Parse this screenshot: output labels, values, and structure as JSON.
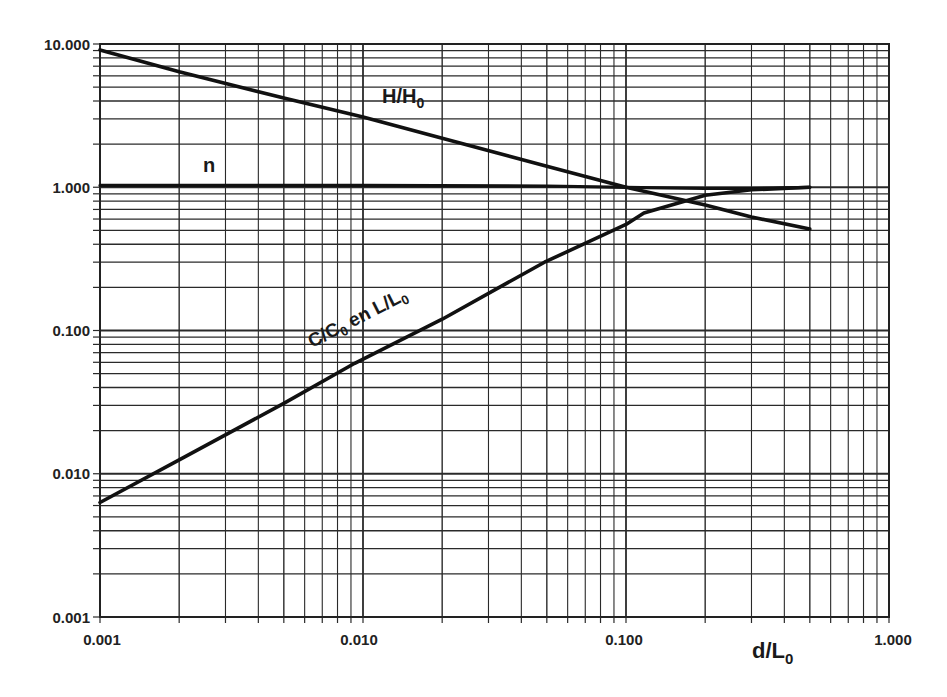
{
  "chart_data": {
    "type": "line",
    "title": "",
    "xlabel": "d/L0",
    "ylabel": "",
    "xscale": "log",
    "yscale": "log",
    "xlim": [
      0.001,
      1.0
    ],
    "ylim": [
      0.001,
      10.0
    ],
    "grid": true,
    "legend": "none (curves labeled inline)",
    "x_tick_labels": [
      "0.001",
      "0.010",
      "0.100",
      "1.000"
    ],
    "y_tick_labels": [
      "10.000",
      "1.000",
      "0.100",
      "0.010",
      "0.001"
    ],
    "series": [
      {
        "name": "H/H0",
        "label_main": "H/H",
        "label_sub": "0",
        "x": [
          0.001,
          0.002,
          0.005,
          0.01,
          0.02,
          0.05,
          0.1,
          0.2,
          0.3,
          0.5
        ],
        "y": [
          9.1,
          6.4,
          4.2,
          3.1,
          2.2,
          1.4,
          1.0,
          0.75,
          0.62,
          0.51
        ]
      },
      {
        "name": "n",
        "label_main": "n",
        "label_sub": "",
        "x": [
          0.001,
          0.01,
          0.05,
          0.1,
          0.2,
          0.3,
          0.5
        ],
        "y": [
          1.03,
          1.03,
          1.02,
          1.0,
          0.98,
          0.98,
          1.0
        ]
      },
      {
        "name": "C/C0 en L/L0",
        "label_main": "C/C",
        "label_sub": "0",
        "label_mid": " en L/L",
        "label_sub2": "0",
        "x": [
          0.001,
          0.002,
          0.005,
          0.0093,
          0.02,
          0.049,
          0.1,
          0.117,
          0.2,
          0.3,
          0.5
        ],
        "y": [
          0.0063,
          0.0125,
          0.031,
          0.059,
          0.12,
          0.3,
          0.55,
          0.66,
          0.88,
          0.96,
          1.0
        ]
      }
    ]
  },
  "axis": {
    "x_title_main": "d/L",
    "x_title_sub": "0"
  }
}
